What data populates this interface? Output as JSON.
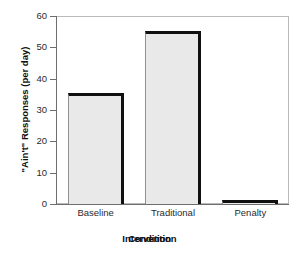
{
  "chart_data": {
    "type": "bar",
    "title": "",
    "subtitle": "",
    "categories": [
      "Baseline",
      "Traditional",
      "Penalty"
    ],
    "values": [
      35.5,
      55.2,
      1.3
    ],
    "series": [
      {
        "name": "\"Ain't\" Responses (per day)",
        "values": [
          35.5,
          55.2,
          1.3
        ]
      }
    ],
    "xlabel": "Intervention",
    "xlabel_overlap": "Condition",
    "ylabel": "\"Ain't\" Responses (per day)",
    "ylim": [
      0,
      60
    ],
    "yticks": [
      0,
      10,
      20,
      30,
      40,
      50,
      60
    ],
    "ytick_labels": [
      "0",
      "10",
      "20",
      "30",
      "40",
      "50",
      "60"
    ],
    "xlim": [
      0,
      3
    ],
    "grid": false,
    "legend": false,
    "legend_position": "none",
    "bar_fill_color": "#e9e9e9",
    "bar_edge_color": "#101010",
    "axis_color": "#6e6e6e",
    "background_color": "#ffffff"
  },
  "axes": {
    "y_title": "\"Ain't\" Responses (per day)",
    "x_title_primary": "Intervention",
    "x_title_secondary": "Condition"
  }
}
